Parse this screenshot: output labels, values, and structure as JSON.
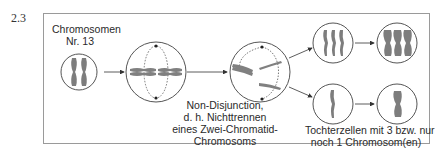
{
  "section_number": "2.3",
  "labels": {
    "chromosome_line1": "Chromosomen",
    "chromosome_line2": "Nr. 13",
    "nondisjunction_line1": "Non-Disjunction,",
    "nondisjunction_line2": "d. h. Nichttrennen",
    "nondisjunction_line3": "eines Zwei-Chromatid-",
    "nondisjunction_line4": "Chromosoms",
    "daughter_line1": "Tochterzellen mit 3 bzw. nur",
    "daughter_line2": "noch 1 Chromosom(en)"
  },
  "colors": {
    "chromosome": "#7a7a7a",
    "outline": "#555555",
    "frame": "#9a9a9a"
  }
}
